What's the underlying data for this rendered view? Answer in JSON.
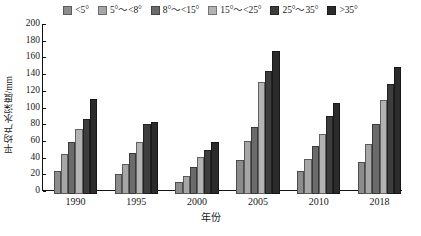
{
  "chart_data": {
    "type": "bar",
    "title": "",
    "xlabel": "年份",
    "ylabel": "平均产水深度/mm",
    "categories": [
      "1990",
      "1995",
      "2000",
      "2005",
      "2010",
      "2018"
    ],
    "ylim": [
      0,
      200
    ],
    "yticks": [
      0,
      20,
      40,
      60,
      80,
      100,
      120,
      140,
      160,
      180,
      200
    ],
    "grid": false,
    "legend_position": "top-center",
    "series": [
      {
        "name": "<5°",
        "color": "#8c8c8c",
        "values": [
          28,
          24,
          14,
          41,
          27,
          38
        ]
      },
      {
        "name": "5°～<8°",
        "color": "#a6a6a6",
        "values": [
          48,
          36,
          22,
          63,
          42,
          60
        ]
      },
      {
        "name": "8°～<15°",
        "color": "#6b6b6b",
        "values": [
          62,
          49,
          32,
          80,
          57,
          84
        ]
      },
      {
        "name": "15°～<25°",
        "color": "#b3b3b3",
        "values": [
          78,
          62,
          44,
          134,
          72,
          112
        ]
      },
      {
        "name": "25°～35°",
        "color": "#3d3d3d",
        "values": [
          90,
          84,
          53,
          147,
          94,
          132
        ]
      },
      {
        "name": ">35°",
        "color": "#2b2b2b",
        "values": [
          114,
          86,
          62,
          171,
          109,
          152
        ]
      }
    ]
  }
}
